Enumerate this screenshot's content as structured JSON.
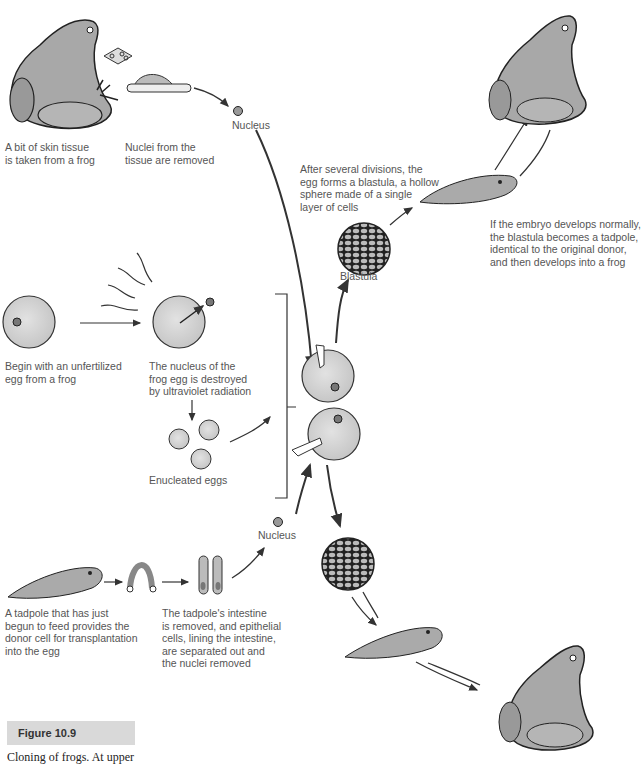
{
  "figure": {
    "number_label": "Figure 10.9",
    "caption": "Cloning of frogs. At upper"
  },
  "labels": {
    "skin_tissue": "A bit of skin tissue\nis taken from a frog",
    "nuclei_removed": "Nuclei from the\ntissue are removed",
    "nucleus_top": "Nucleus",
    "blastula_forms": "After several divisions, the\negg forms a blastula, a hollow\nsphere made of a single\nlayer of cells",
    "embryo_develops": "If the embryo develops normally,\nthe blastula becomes a tadpole,\nidentical to the original donor,\nand then develops into a frog",
    "blastula": "Blastula",
    "unfertilized_egg": "Begin with an unfertilized\negg from a frog",
    "nucleus_destroyed": "The nucleus of the\nfrog egg is destroyed\nby ultraviolet radiation",
    "enucleated_eggs": "Enucleated eggs",
    "nucleus_bottom": "Nucleus",
    "tadpole_donor": "A tadpole that has just\nbegun to feed provides the\ndonor cell for transplantation\ninto the egg",
    "intestine_removed": "The tadpole's intestine\nis removed, and epithelial\ncells, lining the intestine,\nare separated out and\nthe nuclei removed"
  },
  "colors": {
    "egg_fill": "#d4d4d4",
    "outline": "#333333",
    "text": "#555555",
    "figure_box": "#d9d9d9"
  }
}
